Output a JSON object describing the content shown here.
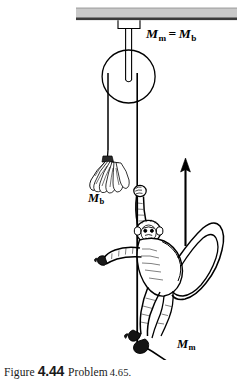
{
  "figure": {
    "caption": {
      "figure_word": "Figure",
      "figure_number": "4.44",
      "problem_word": "Problem",
      "problem_number": "4.65."
    },
    "labels": {
      "equation": {
        "left_symbol": "M",
        "left_subscript": "m",
        "operator": "=",
        "right_symbol": "M",
        "right_subscript": "b"
      },
      "bananas_mass": {
        "symbol": "M",
        "subscript": "b"
      },
      "monkey_mass": {
        "symbol": "M",
        "subscript": "m"
      }
    },
    "elements": {
      "ceiling": "ceiling-beam",
      "bracket": "pulley-bracket",
      "pulley": "pulley-wheel",
      "rope_left": "rope-left-segment",
      "rope_right": "rope-right-segment",
      "bananas": "banana-bunch",
      "monkey": "monkey",
      "arrow": "upward-motion-arrow"
    },
    "colors": {
      "ink": "#000000",
      "ceiling_fill": "#c9c9c9",
      "ceiling_edge": "#3a3a3a",
      "background": "#ffffff"
    }
  }
}
